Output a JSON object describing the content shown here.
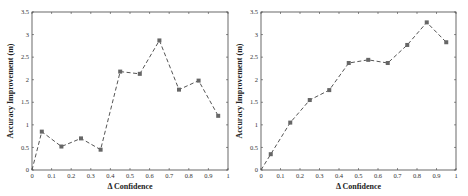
{
  "chart_data": [
    {
      "type": "line",
      "title": "",
      "xlabel": "Δ Confidence",
      "ylabel": "Accuracy Improvement (m)",
      "xlim": [
        0,
        1
      ],
      "ylim": [
        0,
        3.5
      ],
      "x_ticks": [
        "0",
        "0.1",
        "0.2",
        "0.3",
        "0.4",
        "0.5",
        "0.6",
        "0.7",
        "0.8",
        "0.9",
        "1"
      ],
      "y_ticks": [
        "0",
        "0.5",
        "1",
        "1.5",
        "2",
        "2.5",
        "3",
        "3.5"
      ],
      "grid": false,
      "legend": null,
      "line_style": "dashed",
      "marker": "square",
      "x": [
        0,
        0.05,
        0.15,
        0.25,
        0.35,
        0.45,
        0.55,
        0.65,
        0.75,
        0.85,
        0.95
      ],
      "values": [
        0,
        0.85,
        0.52,
        0.7,
        0.45,
        2.18,
        2.13,
        2.87,
        1.78,
        1.98,
        1.2
      ]
    },
    {
      "type": "line",
      "title": "",
      "xlabel": "Δ Confidence",
      "ylabel": "Accuracy Improvement (m)",
      "xlim": [
        0,
        1
      ],
      "ylim": [
        0,
        3.5
      ],
      "x_ticks": [
        "0",
        "0.1",
        "0.2",
        "0.3",
        "0.4",
        "0.5",
        "0.6",
        "0.7",
        "0.8",
        "0.9",
        "1"
      ],
      "y_ticks": [
        "0",
        "0.5",
        "1",
        "1.5",
        "2",
        "2.5",
        "3",
        "3.5"
      ],
      "grid": false,
      "legend": null,
      "line_style": "dashed",
      "marker": "square",
      "x": [
        0,
        0.05,
        0.15,
        0.25,
        0.35,
        0.45,
        0.55,
        0.65,
        0.75,
        0.85,
        0.95
      ],
      "values": [
        0,
        0.35,
        1.05,
        1.55,
        1.77,
        2.37,
        2.44,
        2.37,
        2.77,
        3.27,
        2.83
      ]
    }
  ],
  "style": {
    "line_color": "#555555",
    "marker_color": "#666666",
    "axis_color": "#444444"
  }
}
